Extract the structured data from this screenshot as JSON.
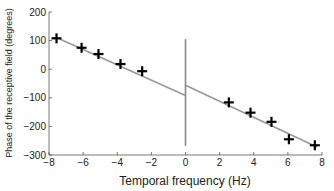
{
  "chart_data": {
    "type": "scatter",
    "title": "",
    "xlabel": "Temporal frequency (Hz)",
    "ylabel": "Phase of the receptive field (degrees)",
    "xlim": [
      -8,
      8
    ],
    "ylim": [
      -300,
      200
    ],
    "xticks": [
      -8,
      -6,
      -4,
      -2,
      0,
      2,
      4,
      6,
      8
    ],
    "yticks": [
      -300,
      -200,
      -100,
      0,
      100,
      200
    ],
    "grid": false,
    "series": [
      {
        "name": "measured phase",
        "marker": "plus",
        "color": "#000000",
        "x": [
          -7.56,
          -6.09,
          -5.1,
          -3.81,
          -2.54,
          2.54,
          3.81,
          5.04,
          6.06,
          7.58
        ],
        "y": [
          108,
          75,
          53,
          18,
          -7,
          -116,
          -152,
          -184,
          -245,
          -266
        ]
      }
    ],
    "fit_lines": [
      {
        "name": "fit-negative-frequencies",
        "color": "#999999",
        "x": [
          -7.6,
          0
        ],
        "y": [
          112,
          -92
        ]
      },
      {
        "name": "fit-positive-frequencies",
        "color": "#999999",
        "x": [
          0,
          7.7
        ],
        "y": [
          -56,
          -272
        ]
      }
    ],
    "vertical_line": {
      "name": "zero-frequency-line",
      "color": "#888888",
      "x": 0,
      "y": [
        105,
        -268
      ]
    }
  }
}
